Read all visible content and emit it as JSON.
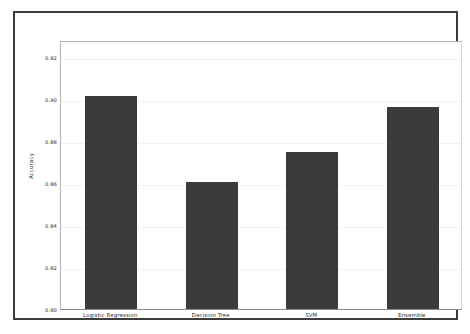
{
  "chart_data": {
    "type": "bar",
    "title": "",
    "xlabel": "",
    "ylabel": "Accuracy",
    "categories": [
      "Logistic Regression",
      "Decision Tree",
      "SVM",
      "Ensemble"
    ],
    "values": [
      0.9015,
      0.8605,
      0.8745,
      0.896
    ],
    "ylim": [
      0.8,
      0.928
    ],
    "yticks": [
      0.8,
      0.82,
      0.84,
      0.86,
      0.88,
      0.9,
      0.92
    ],
    "ytick_labels": [
      "0.80",
      "0.82",
      "0.84",
      "0.86",
      "0.88",
      "0.90",
      "0.92"
    ],
    "grid": true,
    "legend": "none",
    "bar_color": "#3b3b3b",
    "background_color": "#ffffff",
    "frame_color": "#3c3c3c",
    "gridline_color": "#f2f2f2"
  }
}
